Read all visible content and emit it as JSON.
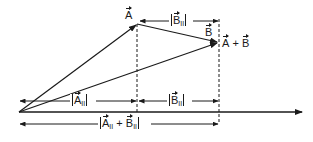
{
  "diagram": {
    "points": {
      "origin": {
        "x": 19,
        "y": 112
      },
      "A_tip": {
        "x": 137,
        "y": 24
      },
      "sum_tip": {
        "x": 218,
        "y": 42
      }
    },
    "axis": {
      "y": 112,
      "x_start": 19,
      "x_end": 300
    },
    "labels": {
      "A": {
        "letter": "A"
      },
      "B": {
        "letter": "B"
      },
      "A_plus_B": {
        "a": "A",
        "plus": "+",
        "b": "B"
      },
      "B_par_top": {
        "letter": "B",
        "sub": "II"
      },
      "A_par": {
        "letter": "A",
        "sub": "II"
      },
      "B_par_bottom": {
        "letter": "B",
        "sub": "II"
      },
      "sum_par": {
        "a": "A",
        "sub_a": "II",
        "plus": "+",
        "b": "B",
        "sub_b": "II"
      }
    },
    "colors": {
      "stroke": "#1a1a1a",
      "background": "#ffffff"
    }
  }
}
